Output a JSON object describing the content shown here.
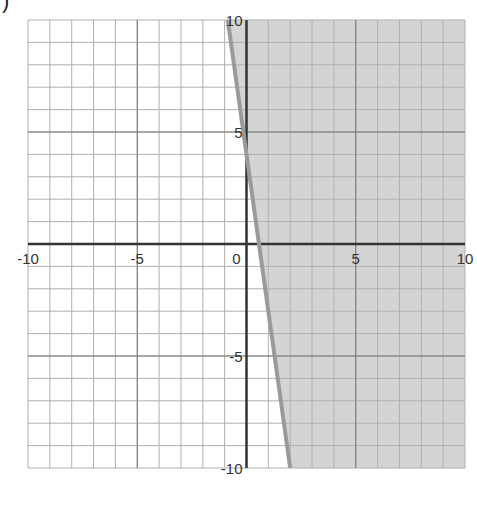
{
  "corner_label": ")",
  "chart_data": {
    "type": "inequality-graph",
    "title": "",
    "xlabel": "",
    "ylabel": "",
    "xlim": [
      -10,
      10
    ],
    "ylim": [
      -10,
      10
    ],
    "grid": true,
    "grid_step": 1,
    "x_ticks": [
      {
        "value": -10,
        "label": "-10"
      },
      {
        "value": -5,
        "label": "-5"
      },
      {
        "value": 0,
        "label": "0"
      },
      {
        "value": 5,
        "label": "5"
      },
      {
        "value": 10,
        "label": "10"
      }
    ],
    "y_ticks": [
      {
        "value": 10,
        "label": "10"
      },
      {
        "value": 5,
        "label": "5"
      },
      {
        "value": -5,
        "label": "-5"
      },
      {
        "value": -10,
        "label": "-10"
      }
    ],
    "boundary_line": {
      "equation": "y = -7x + 4",
      "slope": -7,
      "intercept": 4,
      "style": "solid",
      "points": [
        [
          -0.86,
          10
        ],
        [
          0.57,
          0
        ],
        [
          2.0,
          -10
        ]
      ]
    },
    "shaded_region": "y >= -7x + 4 (right of line)",
    "colors": {
      "shade": "#d4d4d4",
      "line": "#9a9a9a",
      "grid": "#b0b0b0",
      "axis": "#333333"
    }
  }
}
